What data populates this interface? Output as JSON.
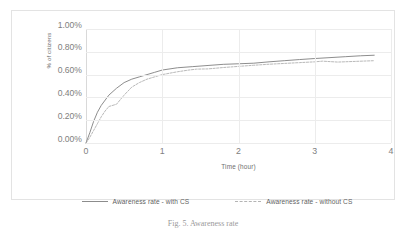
{
  "chart_data": {
    "type": "line",
    "title": "",
    "xlabel": "Time (hour)",
    "ylabel": "% of citizens",
    "xlim": [
      0,
      4
    ],
    "ylim": [
      0,
      0.01
    ],
    "xticks": [
      "0",
      "1",
      "2",
      "3",
      "4"
    ],
    "xtick_values": [
      0,
      1,
      2,
      3,
      4
    ],
    "yticks": [
      "0.00%",
      "0.20%",
      "0.40%",
      "0.60%",
      "0.80%",
      "1.00%"
    ],
    "ytick_values": [
      0,
      0.002,
      0.004,
      0.006,
      0.008,
      0.01
    ],
    "grid": "horizontal-and-vertical",
    "legend_position": "bottom",
    "series": [
      {
        "name": "Awareness rate - with CS",
        "style": "solid",
        "color": "#808080",
        "x": [
          0,
          0.05,
          0.1,
          0.15,
          0.2,
          0.3,
          0.4,
          0.5,
          0.6,
          0.7,
          0.8,
          0.9,
          1.0,
          1.2,
          1.4,
          1.6,
          1.8,
          2.0,
          2.2,
          2.4,
          2.6,
          2.8,
          3.0,
          3.2,
          3.4,
          3.6,
          3.78
        ],
        "y": [
          0.0,
          0.0009,
          0.0019,
          0.0027,
          0.0033,
          0.0042,
          0.0048,
          0.0053,
          0.0056,
          0.0058,
          0.006,
          0.0062,
          0.0064,
          0.0066,
          0.0067,
          0.0068,
          0.0069,
          0.00695,
          0.007,
          0.00712,
          0.00722,
          0.00732,
          0.00741,
          0.00749,
          0.00757,
          0.00765,
          0.0077
        ]
      },
      {
        "name": "Awareness rate - without CS",
        "style": "dashed",
        "color": "#b0b0b0",
        "x": [
          0,
          0.05,
          0.1,
          0.15,
          0.2,
          0.25,
          0.3,
          0.4,
          0.5,
          0.6,
          0.7,
          0.8,
          0.9,
          1.0,
          1.2,
          1.35,
          1.45,
          1.6,
          1.8,
          2.0,
          2.2,
          2.4,
          2.6,
          2.8,
          3.0,
          3.1,
          3.3,
          3.5,
          3.78
        ],
        "y": [
          0.0,
          0.0005,
          0.0011,
          0.0017,
          0.0023,
          0.0028,
          0.0032,
          0.0034,
          0.0042,
          0.0049,
          0.0053,
          0.0056,
          0.0058,
          0.006,
          0.00625,
          0.0064,
          0.00648,
          0.0065,
          0.00662,
          0.00672,
          0.00682,
          0.00691,
          0.00698,
          0.00705,
          0.00712,
          0.00718,
          0.0071,
          0.00715,
          0.00722
        ]
      }
    ]
  },
  "legend": {
    "items": [
      {
        "label": "Awareness rate - with CS",
        "style": "solid"
      },
      {
        "label": "Awareness rate - without CS",
        "style": "dashed"
      }
    ]
  },
  "caption": {
    "text": "Fig. 5.  Awareness rate"
  }
}
